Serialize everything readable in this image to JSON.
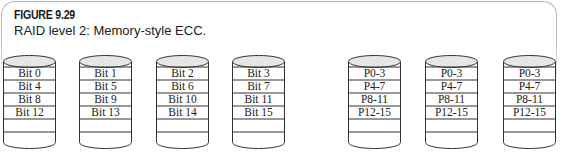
{
  "figure": {
    "label": "FIGURE 9.29",
    "caption": "RAID level 2: Memory-style ECC."
  },
  "colors": {
    "outline": "#333333",
    "cap_fill": "#e6e6e6",
    "frame": "#b8b8b8"
  },
  "data_disks": [
    {
      "rows": [
        "Bit 0",
        "Bit 4",
        "Bit 8",
        "Bit 12"
      ]
    },
    {
      "rows": [
        "Bit 1",
        "Bit 5",
        "Bit 9",
        "Bit 13"
      ]
    },
    {
      "rows": [
        "Bit 2",
        "Bit 6",
        "Bit 10",
        "Bit 14"
      ]
    },
    {
      "rows": [
        "Bit 3",
        "Bit 7",
        "Bit 11",
        "Bit 15"
      ]
    }
  ],
  "ecc_disks": [
    {
      "rows": [
        "P0-3",
        "P4-7",
        "P8-11",
        "P12-15"
      ]
    },
    {
      "rows": [
        "P0-3",
        "P4-7",
        "P8-11",
        "P12-15"
      ]
    },
    {
      "rows": [
        "P0-3",
        "P4-7",
        "P8-11",
        "P12-15"
      ]
    }
  ]
}
